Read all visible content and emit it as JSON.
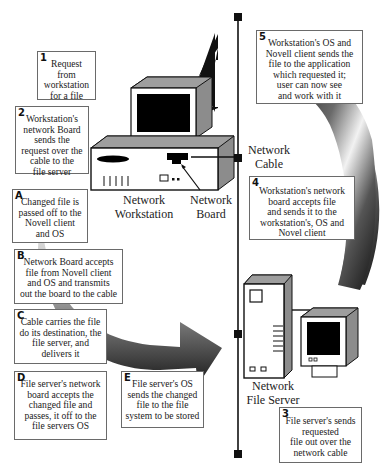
{
  "diagram": {
    "cable_label": "Network\nCable",
    "workstation_label": "Network\nWorkstation",
    "board_label": "Network\nBoard",
    "server_label": "Network\nFile Server",
    "steps": [
      {
        "tag": "1",
        "text": "Request\nfrom\nworkstation\nfor a file"
      },
      {
        "tag": "2",
        "text": "Workstation's\nnetwork Board\nsends the\nrequest over the\ncable to the\nfile server"
      },
      {
        "tag": "3",
        "text": "File server's sends\nrequested\nfile out over the\nnetwork cable"
      },
      {
        "tag": "4",
        "text": "Workstation's network\nboard accepts file\nand sends it to the\nworkstation's, OS and\nNovel client"
      },
      {
        "tag": "5",
        "text": "Workstation's OS and\nNovell client sends the\nfile to the application\nwhich requested it;\nuser can now see\nand work with it"
      },
      {
        "tag": "A",
        "text": "Changed file is\npassed off to the\nNovell client\nand OS"
      },
      {
        "tag": "B",
        "text": "Network Board accepts\nfile from Novell client\nand OS and transmits\nout the board to the cable"
      },
      {
        "tag": "C",
        "text": "Cable carries the file\ndo its destination, the\nfile server, and\ndelivers it"
      },
      {
        "tag": "D",
        "text": "File server's network\nboard accepts the\nchanged file and\npasses, it off to the\nfile servers OS"
      },
      {
        "tag": "E",
        "text": "File server's OS\nsends the changed\nfile to the file\nsystem to be stored"
      }
    ]
  }
}
